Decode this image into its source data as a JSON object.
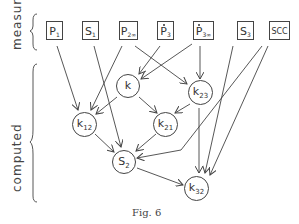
{
  "labels": {
    "measured": "measured",
    "computed": "computed"
  },
  "measured_nodes": [
    {
      "id": "P1",
      "main": "P",
      "sub": "1",
      "dot": false
    },
    {
      "id": "S1",
      "main": "S",
      "sub": "1",
      "dot": false
    },
    {
      "id": "P2inf",
      "main": "P",
      "sub": "2∞",
      "dot": false
    },
    {
      "id": "P3dot",
      "main": "P",
      "sub": "3",
      "dot": true
    },
    {
      "id": "P3infdot",
      "main": "P",
      "sub": "3∞",
      "dot": true
    },
    {
      "id": "S3",
      "main": "S",
      "sub": "3",
      "dot": false
    },
    {
      "id": "SCC",
      "main": "SCC",
      "sub": "",
      "dot": false
    }
  ],
  "computed_nodes": [
    {
      "id": "k",
      "main": "k",
      "sub": ""
    },
    {
      "id": "k23",
      "main": "k",
      "sub": "23"
    },
    {
      "id": "k12",
      "main": "k",
      "sub": "12"
    },
    {
      "id": "k21",
      "main": "k",
      "sub": "21"
    },
    {
      "id": "S2",
      "main": "S",
      "sub": "2"
    },
    {
      "id": "k32",
      "main": "k",
      "sub": "32"
    }
  ],
  "edges": [
    [
      "P1",
      "k12"
    ],
    [
      "S1",
      "S2"
    ],
    [
      "P2inf",
      "k12"
    ],
    [
      "P2inf",
      "k23"
    ],
    [
      "P3dot",
      "k"
    ],
    [
      "P3infdot",
      "k"
    ],
    [
      "P3infdot",
      "k23"
    ],
    [
      "k",
      "k12"
    ],
    [
      "k",
      "k21"
    ],
    [
      "k23",
      "k21"
    ],
    [
      "k23",
      "k32"
    ],
    [
      "S3",
      "k32"
    ],
    [
      "SCC",
      "S2"
    ],
    [
      "SCC",
      "k32"
    ],
    [
      "k12",
      "S2"
    ],
    [
      "k21",
      "S2"
    ],
    [
      "S2",
      "k32"
    ]
  ],
  "caption": "Fig. 6"
}
